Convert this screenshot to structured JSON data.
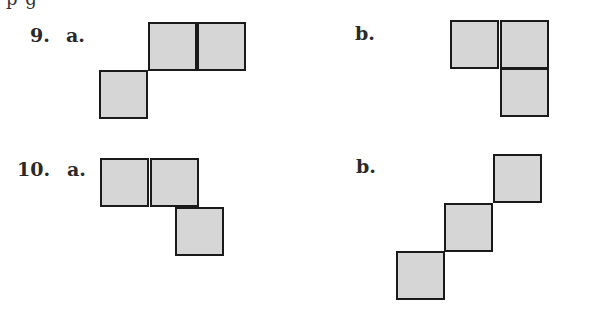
{
  "page": {
    "top_cutoff_text": "p                                  g"
  },
  "problems": [
    {
      "number": "9.",
      "parts": [
        {
          "label": "a.",
          "squares": [
            [
              148,
              22
            ],
            [
              197,
              22
            ],
            [
              99,
              70
            ]
          ]
        },
        {
          "label": "b.",
          "squares": [
            [
              450,
              20
            ],
            [
              500,
              20
            ],
            [
              500,
              68
            ]
          ]
        }
      ]
    },
    {
      "number": "10.",
      "parts": [
        {
          "label": "a.",
          "squares": [
            [
              100,
              158
            ],
            [
              150,
              158
            ],
            [
              175,
              207
            ]
          ]
        },
        {
          "label": "b.",
          "squares": [
            [
              493,
              154
            ],
            [
              444,
              203
            ],
            [
              396,
              251
            ]
          ]
        }
      ]
    }
  ],
  "colors": {
    "square_fill": "#d6d6d6",
    "square_border": "#1a1a1a"
  }
}
